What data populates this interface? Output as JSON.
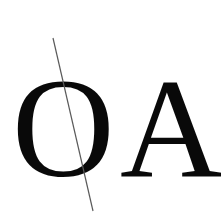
{
  "image": {
    "width": 221,
    "height": 216,
    "background_color": "#ffffff"
  },
  "content": {
    "text_full": "OA",
    "letter_first": "O",
    "letter_second": "A",
    "text_color": "#090909"
  },
  "annotation_line": {
    "name": "diagonal-stroke",
    "color": "#5a5a5a",
    "width_px": 1.2,
    "x1": 53,
    "y1": 38,
    "x2": 93,
    "y2": 211
  }
}
